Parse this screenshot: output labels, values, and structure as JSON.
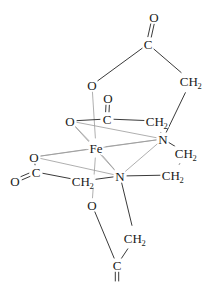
{
  "diagram": {
    "type": "chemical-structure",
    "width": 214,
    "height": 282,
    "colors": {
      "background": "#ffffff",
      "bond_dark": "#3a3a3a",
      "bond_light": "#9a9a9a",
      "label": "#1a1a1a"
    },
    "atoms": [
      {
        "id": "O_top_carbonyl",
        "label": "O",
        "sub": "",
        "x": 154,
        "y": 17,
        "element": "oxygen"
      },
      {
        "id": "C_top",
        "label": "C",
        "sub": "",
        "x": 148,
        "y": 44,
        "element": "carbon"
      },
      {
        "id": "CH2_top_right",
        "label": "CH",
        "sub": "2",
        "x": 191,
        "y": 81,
        "element": "methylene"
      },
      {
        "id": "O_top_left",
        "label": "O",
        "sub": "",
        "x": 92,
        "y": 85,
        "element": "oxygen"
      },
      {
        "id": "O_mid_carbonyl",
        "label": "O",
        "sub": "",
        "x": 108,
        "y": 98,
        "element": "oxygen"
      },
      {
        "id": "C_mid",
        "label": "C",
        "sub": "",
        "x": 107,
        "y": 119,
        "element": "carbon"
      },
      {
        "id": "CH2_mid",
        "label": "CH",
        "sub": "2",
        "x": 157,
        "y": 121,
        "element": "methylene"
      },
      {
        "id": "O_left_upper",
        "label": "O",
        "sub": "",
        "x": 70,
        "y": 121,
        "element": "oxygen"
      },
      {
        "id": "N_upper",
        "label": "N",
        "sub": "",
        "x": 163,
        "y": 139,
        "element": "nitrogen"
      },
      {
        "id": "Fe_center",
        "label": "Fe",
        "sub": "",
        "x": 96,
        "y": 148,
        "element": "iron"
      },
      {
        "id": "CH2_right_upper",
        "label": "CH",
        "sub": "2",
        "x": 186,
        "y": 153,
        "element": "methylene"
      },
      {
        "id": "O_left_lower",
        "label": "O",
        "sub": "",
        "x": 34,
        "y": 157,
        "element": "oxygen"
      },
      {
        "id": "C_left",
        "label": "C",
        "sub": "",
        "x": 36,
        "y": 172,
        "element": "carbon"
      },
      {
        "id": "CH2_right_lower",
        "label": "CH",
        "sub": "2",
        "x": 173,
        "y": 175,
        "element": "methylene"
      },
      {
        "id": "N_lower",
        "label": "N",
        "sub": "",
        "x": 120,
        "y": 176,
        "element": "nitrogen"
      },
      {
        "id": "O_far_left",
        "label": "O",
        "sub": "",
        "x": 15,
        "y": 181,
        "element": "oxygen"
      },
      {
        "id": "CH2_left_lower",
        "label": "CH",
        "sub": "2",
        "x": 83,
        "y": 181,
        "element": "methylene"
      },
      {
        "id": "O_bottom",
        "label": "O",
        "sub": "",
        "x": 92,
        "y": 205,
        "element": "oxygen"
      },
      {
        "id": "CH2_bottom",
        "label": "CH",
        "sub": "2",
        "x": 135,
        "y": 238,
        "element": "methylene"
      },
      {
        "id": "C_bottom",
        "label": "C",
        "sub": "",
        "x": 117,
        "y": 265,
        "element": "carbon"
      },
      {
        "id": "O_bottom_cut",
        "label": "O",
        "sub": "",
        "x": 117,
        "y": 288,
        "element": "oxygen"
      }
    ],
    "bonds": [
      {
        "from": "C_top",
        "to": "O_top_carbonyl",
        "order": 2,
        "style": "dark"
      },
      {
        "from": "C_top",
        "to": "O_top_left",
        "order": 1,
        "style": "dark"
      },
      {
        "from": "C_top",
        "to": "CH2_top_right",
        "order": 1,
        "style": "dark"
      },
      {
        "from": "CH2_top_right",
        "to": "N_upper",
        "order": 1,
        "style": "dark"
      },
      {
        "from": "O_top_left",
        "to": "Fe_center",
        "order": 1,
        "style": "light"
      },
      {
        "from": "C_mid",
        "to": "O_mid_carbonyl",
        "order": 2,
        "style": "dark"
      },
      {
        "from": "C_mid",
        "to": "O_left_upper",
        "order": 1,
        "style": "dark"
      },
      {
        "from": "C_mid",
        "to": "CH2_mid",
        "order": 1,
        "style": "dark"
      },
      {
        "from": "CH2_mid",
        "to": "N_upper",
        "order": 1,
        "style": "dark"
      },
      {
        "from": "O_left_upper",
        "to": "Fe_center",
        "order": 1,
        "style": "light"
      },
      {
        "from": "O_left_upper",
        "to": "N_upper",
        "order": 1,
        "style": "light"
      },
      {
        "from": "O_left_upper",
        "to": "N_lower",
        "order": 1,
        "style": "light"
      },
      {
        "from": "Fe_center",
        "to": "N_upper",
        "order": 1,
        "style": "light"
      },
      {
        "from": "Fe_center",
        "to": "N_lower",
        "order": 1,
        "style": "light"
      },
      {
        "from": "Fe_center",
        "to": "O_left_lower",
        "order": 1,
        "style": "light"
      },
      {
        "from": "Fe_center",
        "to": "O_bottom",
        "order": 1,
        "style": "light"
      },
      {
        "from": "N_upper",
        "to": "N_lower",
        "order": 1,
        "style": "light"
      },
      {
        "from": "N_upper",
        "to": "O_left_lower",
        "order": 1,
        "style": "light"
      },
      {
        "from": "N_upper",
        "to": "CH2_right_upper",
        "order": 1,
        "style": "dark"
      },
      {
        "from": "CH2_right_upper",
        "to": "CH2_right_lower",
        "order": 1,
        "style": "dark"
      },
      {
        "from": "CH2_right_lower",
        "to": "N_lower",
        "order": 1,
        "style": "dark"
      },
      {
        "from": "C_left",
        "to": "O_far_left",
        "order": 2,
        "style": "dark"
      },
      {
        "from": "C_left",
        "to": "O_left_lower",
        "order": 1,
        "style": "dark"
      },
      {
        "from": "C_left",
        "to": "CH2_left_lower",
        "order": 1,
        "style": "dark"
      },
      {
        "from": "CH2_left_lower",
        "to": "N_lower",
        "order": 1,
        "style": "dark"
      },
      {
        "from": "O_left_lower",
        "to": "N_lower",
        "order": 1,
        "style": "light"
      },
      {
        "from": "N_lower",
        "to": "CH2_bottom",
        "order": 1,
        "style": "dark"
      },
      {
        "from": "CH2_bottom",
        "to": "C_bottom",
        "order": 1,
        "style": "dark"
      },
      {
        "from": "C_bottom",
        "to": "O_bottom",
        "order": 1,
        "style": "dark"
      },
      {
        "from": "C_bottom",
        "to": "O_bottom_cut",
        "order": 2,
        "style": "dark"
      }
    ]
  }
}
